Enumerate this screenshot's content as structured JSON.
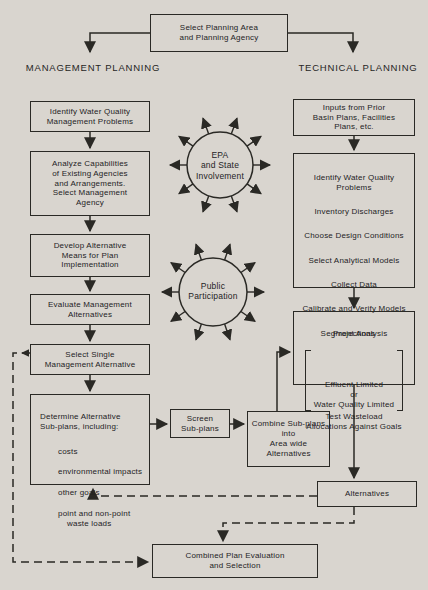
{
  "colors": {
    "paper": "#d9d5cf",
    "ink": "#2a2925"
  },
  "header": {
    "select_box": "Select Planning Area\nand Planning Agency",
    "left_branch_label": "MANAGEMENT PLANNING",
    "right_branch_label": "TECHNICAL PLANNING"
  },
  "circles": {
    "epa": "EPA\nand State\nInvolvement",
    "public": "Public\nParticipation"
  },
  "management": {
    "identify": "Identify Water Quality\nManagement Problems",
    "analyze": "Analyze Capabilities\nof Existing Agencies\nand Arrangements.\nSelect Management\nAgency",
    "develop": "Develop Alternative\nMeans for Plan\nImplementation",
    "evaluate": "Evaluate Management\nAlternatives",
    "select_single": "Select Single\nManagement Alternative",
    "determine_title": "Determine Alternative\nSub-plans, including:",
    "determine_items": [
      "costs",
      "environmental impacts",
      "other goals",
      "point and non-point waste loads"
    ]
  },
  "middle": {
    "screen": "Screen\nSub-plans",
    "combine": "Combine Sub-plans\ninto\nArea wide\nAlternatives"
  },
  "technical": {
    "inputs": "Inputs from Prior\nBasin Plans, Facilities\nPlans, etc.",
    "steps": [
      "Identify Water Quality Problems",
      "Inventory Discharges",
      "Choose Design Conditions",
      "Select Analytical Models",
      "Collect Data",
      "Calibrate and Verify Models",
      "Projections"
    ],
    "segment_line1": "Segment Analysis",
    "segment_bracket": "Effluent Limited\nor\nWater Quality Limited",
    "segment_line2": "Test Wasteload\nAllocations Against Goals",
    "alternatives": "Alternatives"
  },
  "footer": {
    "combined": "Combined Plan Evaluation\nand Selection"
  }
}
